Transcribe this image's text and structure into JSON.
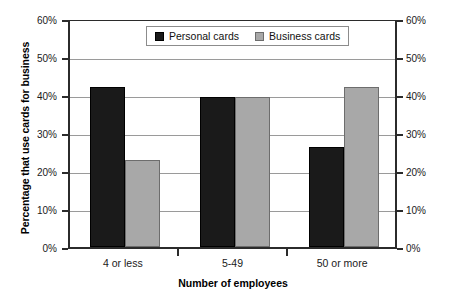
{
  "chart_data": {
    "type": "bar",
    "title": "",
    "xlabel": "Number of employees",
    "ylabel": "Percentage that use cards for business",
    "categories": [
      "4 or less",
      "5-49",
      "50 or more"
    ],
    "series": [
      {
        "name": "Personal cards",
        "values": [
          42.0,
          39.5,
          26.3
        ],
        "color": "#1a1a1a"
      },
      {
        "name": "Business cards",
        "values": [
          23.0,
          39.5,
          42.0
        ],
        "color": "#a8a8a8"
      }
    ],
    "ylim": [
      0,
      60
    ],
    "ytick_labels": [
      "60%",
      "50%",
      "40%",
      "30%",
      "20%",
      "10%",
      "0%"
    ],
    "ytick_values": [
      60,
      50,
      40,
      30,
      20,
      10,
      0
    ],
    "right_axis": {
      "ylim": [
        0,
        60
      ],
      "ytick_labels": [
        "60%",
        "50%",
        "40%",
        "30%",
        "20%",
        "10%",
        "0%"
      ],
      "ytick_values": [
        60,
        50,
        40,
        30,
        20,
        10,
        0
      ]
    },
    "grid": true,
    "legend_position": "top-center",
    "legend_entries": [
      "Personal cards",
      "Business cards"
    ]
  },
  "axes": {
    "y_title": "Percentage that use cards for business",
    "x_title": "Number of employees",
    "y_ticks": [
      {
        "label": "60%",
        "value": 60
      },
      {
        "label": "50%",
        "value": 50
      },
      {
        "label": "40%",
        "value": 40
      },
      {
        "label": "30%",
        "value": 30
      },
      {
        "label": "20%",
        "value": 20
      },
      {
        "label": "10%",
        "value": 10
      },
      {
        "label": "0%",
        "value": 0
      }
    ],
    "x_ticks": [
      {
        "label": "4 or less"
      },
      {
        "label": "5-49"
      },
      {
        "label": "50 or more"
      }
    ]
  },
  "legend": {
    "items": [
      {
        "label": "Personal cards",
        "swatch": "legend-swatch-personal"
      },
      {
        "label": "Business cards",
        "swatch": "legend-swatch-business"
      }
    ]
  }
}
